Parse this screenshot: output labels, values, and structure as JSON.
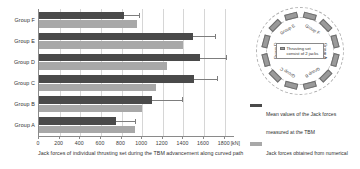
{
  "chart_data": {
    "type": "bar",
    "orientation": "horizontal",
    "title": "",
    "xlabel": "Jack forces of individual thrusting set during the TBM advancement along curved path",
    "xunit": "[kN]",
    "ylabel": "",
    "xlim": [
      0,
      1900
    ],
    "xticks": [
      0,
      200,
      400,
      600,
      800,
      1000,
      1200,
      1400,
      1600,
      1800
    ],
    "xticklabels": [
      "0",
      "200",
      "400",
      "600",
      "800",
      "1000",
      "1200",
      "1400",
      "1600",
      "1800"
    ],
    "grid": "vertical",
    "categories": [
      "Group F",
      "Group E",
      "Group D",
      "Group C",
      "Group B",
      "Group A"
    ],
    "series": [
      {
        "name": "Mean values of the Jack forces measured at the TBM",
        "color": "#4a4a4a",
        "values": [
          820,
          1490,
          1560,
          1500,
          1100,
          750
        ],
        "errors": [
          150,
          220,
          250,
          230,
          290,
          180
        ]
      },
      {
        "name": "Jack forces obtained from numerical simulation using steering algorithm",
        "color": "#a8a8a8",
        "values": [
          950,
          1400,
          1240,
          1130,
          1000,
          930
        ],
        "errors": [
          null,
          null,
          null,
          null,
          null,
          null
        ]
      }
    ],
    "legend_position": "right",
    "legend": [
      {
        "label": "Mean values of the Jack forces measured at the TBM",
        "marker": "bar",
        "color": "#4a4a4a"
      },
      {
        "label": "Jack forces obtained from numerical simulation using steering algorithm",
        "marker": "bar",
        "color": "#a8a8a8"
      },
      {
        "label": "Standard deviations",
        "marker": "line",
        "color": "#7d7d7d"
      }
    ]
  },
  "legend": {
    "items": [
      {
        "label": "Mean values of the Jack forces measured at the TBM"
      },
      {
        "label": "Jack forces obtained from numerical simulation using steering algorithm"
      },
      {
        "label": "Standard deviations"
      }
    ]
  },
  "tbm_diagram": {
    "center_note": "Thrusting set consist of 2 jacks",
    "sectors": [
      "Group F",
      "Group A",
      "Group B",
      "Group C",
      "Group D",
      "Group E"
    ]
  }
}
